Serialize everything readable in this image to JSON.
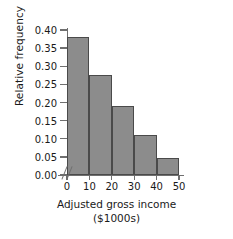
{
  "chart_data": {
    "type": "bar",
    "title": "",
    "subtitle": "",
    "xlabel": "Adjusted gross income",
    "xlabel_units": "($1000s)",
    "ylabel": "Relative frequency",
    "categories": [
      "0-10",
      "10-20",
      "20-30",
      "30-40",
      "40-50"
    ],
    "bin_edges": [
      0,
      10,
      20,
      30,
      40,
      50
    ],
    "values": [
      0.38,
      0.275,
      0.19,
      0.11,
      0.048
    ],
    "xlim": [
      0,
      50
    ],
    "ylim": [
      0.0,
      0.4
    ],
    "x_ticks": [
      "0",
      "10",
      "20",
      "30",
      "40",
      "50"
    ],
    "x_tick_values": [
      0,
      10,
      20,
      30,
      40,
      50
    ],
    "y_ticks": [
      "0.00",
      "0.05",
      "0.10",
      "0.15",
      "0.20",
      "0.25",
      "0.30",
      "0.35",
      "0.40"
    ],
    "y_tick_values": [
      0.0,
      0.05,
      0.1,
      0.15,
      0.2,
      0.25,
      0.3,
      0.35,
      0.4
    ],
    "grid": false,
    "legend": false,
    "legend_position": "none",
    "axis_break_x": true,
    "bar_fill_color": "#8c8c8c",
    "bar_edge_color": "#4a4a4a",
    "axis_color": "#6f6f6f",
    "text_color": "#1a1a1a",
    "background_color": "#ffffff"
  }
}
